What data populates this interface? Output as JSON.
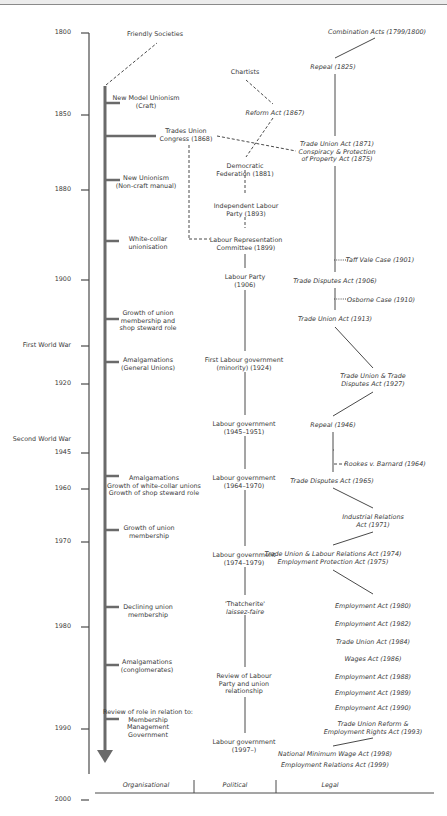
{
  "axis": {
    "years": [
      {
        "label": "1800",
        "y": 7
      },
      {
        "label": "1850",
        "y": 89
      },
      {
        "label": "1880",
        "y": 164
      },
      {
        "label": "1900",
        "y": 254
      },
      {
        "label": "First World War",
        "y": 320
      },
      {
        "label": "1920",
        "y": 358
      },
      {
        "label": "Second World War",
        "y": 414
      },
      {
        "label": "1945",
        "y": 427
      },
      {
        "label": "1960",
        "y": 463
      },
      {
        "label": "1970",
        "y": 516
      },
      {
        "label": "1980",
        "y": 601
      },
      {
        "label": "1990",
        "y": 703
      },
      {
        "label": "2000",
        "y": 774
      }
    ]
  },
  "columns": {
    "organisational": "Organisational",
    "political": "Political",
    "legal": "Legal"
  },
  "organisational": [
    {
      "lines": [
        "Friendly Societies"
      ],
      "x": 155,
      "y": 31
    },
    {
      "lines": [
        "New Model Unionism",
        "(Craft)"
      ],
      "x": 146,
      "y": 95
    },
    {
      "lines": [
        "Trades Union",
        "Congress (1868)"
      ],
      "x": 186,
      "y": 128
    },
    {
      "lines": [
        "New Unionism",
        "(Non-craft manual)"
      ],
      "x": 146,
      "y": 175
    },
    {
      "lines": [
        "White-collar",
        "unionisation"
      ],
      "x": 148,
      "y": 236
    },
    {
      "lines": [
        "Growth of union",
        "membership and",
        "shop steward role"
      ],
      "x": 148,
      "y": 310
    },
    {
      "lines": [
        "Amalgamations",
        "(General Unions)"
      ],
      "x": 148,
      "y": 357
    },
    {
      "lines": [
        "Amalgamations",
        "Growth of white-collar unions",
        "Growth of shop steward role"
      ],
      "x": 154,
      "y": 475
    },
    {
      "lines": [
        "Growth of union",
        "membership"
      ],
      "x": 149,
      "y": 525
    },
    {
      "lines": [
        "Declining union",
        "membership"
      ],
      "x": 148,
      "y": 604
    },
    {
      "lines": [
        "Amalgamations",
        "(conglomerates)"
      ],
      "x": 147,
      "y": 659
    },
    {
      "lines": [
        "Review of role in relation to:",
        "Membership",
        "Management",
        "Government"
      ],
      "x": 148,
      "y": 709
    }
  ],
  "political": [
    {
      "lines": [
        "Chartists"
      ],
      "x": 245,
      "y": 69
    },
    {
      "lines": [
        "Reform Act (1867)"
      ],
      "x": 275,
      "y": 110,
      "italic": true
    },
    {
      "lines": [
        "Democratic",
        "Federation (1881)"
      ],
      "x": 245,
      "y": 163
    },
    {
      "lines": [
        "Independent Labour",
        "Party (1893)"
      ],
      "x": 246,
      "y": 203
    },
    {
      "lines": [
        "Labour Representation",
        "Committee (1899)"
      ],
      "x": 246,
      "y": 237
    },
    {
      "lines": [
        "Labour Party",
        "(1906)"
      ],
      "x": 245,
      "y": 274
    },
    {
      "lines": [
        "First Labour government",
        "(minority) (1924)"
      ],
      "x": 244,
      "y": 357
    },
    {
      "lines": [
        "Labour government",
        "(1945–1951)"
      ],
      "x": 244,
      "y": 421
    },
    {
      "lines": [
        "Labour government",
        "(1964–1970)"
      ],
      "x": 244,
      "y": 475
    },
    {
      "lines": [
        "Labour government",
        "(1974–1979)"
      ],
      "x": 244,
      "y": 552
    },
    {
      "lines": [
        "'Thatcherite'",
        "laissez-faire"
      ],
      "x": 245,
      "y": 601,
      "italic_second": true
    },
    {
      "lines": [
        "Review of Labour",
        "Party and union",
        "relationship"
      ],
      "x": 244,
      "y": 673
    },
    {
      "lines": [
        "Labour government",
        "(1997–)"
      ],
      "x": 244,
      "y": 739
    }
  ],
  "legal": [
    {
      "lines": [
        "Combination Acts (1799/1800)"
      ],
      "x": 377,
      "y": 29
    },
    {
      "lines": [
        "Repeal (1825)"
      ],
      "x": 333,
      "y": 64
    },
    {
      "lines": [
        "Trade Union Act (1871)",
        "Conspiracy & Protection",
        "of Property Act (1875)"
      ],
      "x": 337,
      "y": 141
    },
    {
      "lines": [
        "Taff Vale Case (1901)"
      ],
      "x": 380,
      "y": 257
    },
    {
      "lines": [
        "Trade Disputes Act (1906)"
      ],
      "x": 335,
      "y": 278
    },
    {
      "lines": [
        "Osborne Case (1910)"
      ],
      "x": 381,
      "y": 297
    },
    {
      "lines": [
        "Trade Union Act (1913)"
      ],
      "x": 335,
      "y": 316
    },
    {
      "lines": [
        "Trade Union & Trade",
        "Disputes Act (1927)"
      ],
      "x": 373,
      "y": 373
    },
    {
      "lines": [
        "Repeal (1946)"
      ],
      "x": 333,
      "y": 422
    },
    {
      "lines": [
        "Rookes v. Barnard (1964)"
      ],
      "x": 385,
      "y": 461
    },
    {
      "lines": [
        "Trade Disputes Act (1965)"
      ],
      "x": 332,
      "y": 478
    },
    {
      "lines": [
        "Industrial Relations",
        "Act (1971)"
      ],
      "x": 373,
      "y": 514
    },
    {
      "lines": [
        "Trade Union & Labour Relations Act (1974)",
        "Employment Protection Act (1975)"
      ],
      "x": 333,
      "y": 551
    },
    {
      "lines": [
        "Employment Act (1980)"
      ],
      "x": 373,
      "y": 603
    },
    {
      "lines": [
        "Employment Act (1982)"
      ],
      "x": 373,
      "y": 621
    },
    {
      "lines": [
        "Trade Union Act (1984)"
      ],
      "x": 373,
      "y": 639
    },
    {
      "lines": [
        "Wages Act (1986)"
      ],
      "x": 373,
      "y": 656
    },
    {
      "lines": [
        "Employment Act (1988)"
      ],
      "x": 373,
      "y": 674
    },
    {
      "lines": [
        "Employment Act (1989)"
      ],
      "x": 373,
      "y": 690
    },
    {
      "lines": [
        "Employment Act (1990)"
      ],
      "x": 373,
      "y": 705
    },
    {
      "lines": [
        "Trade Union Reform &",
        "Employment Rights Act (1993)"
      ],
      "x": 373,
      "y": 721
    },
    {
      "lines": [
        "National Minimum Wage Act (1998)"
      ],
      "x": 335,
      "y": 751
    },
    {
      "lines": [
        "Employment Relations Act (1999)"
      ],
      "x": 335,
      "y": 762
    }
  ],
  "colors": {
    "line": "#4a4a4a",
    "arrow": "#666666",
    "text": "#3a3a3a"
  }
}
